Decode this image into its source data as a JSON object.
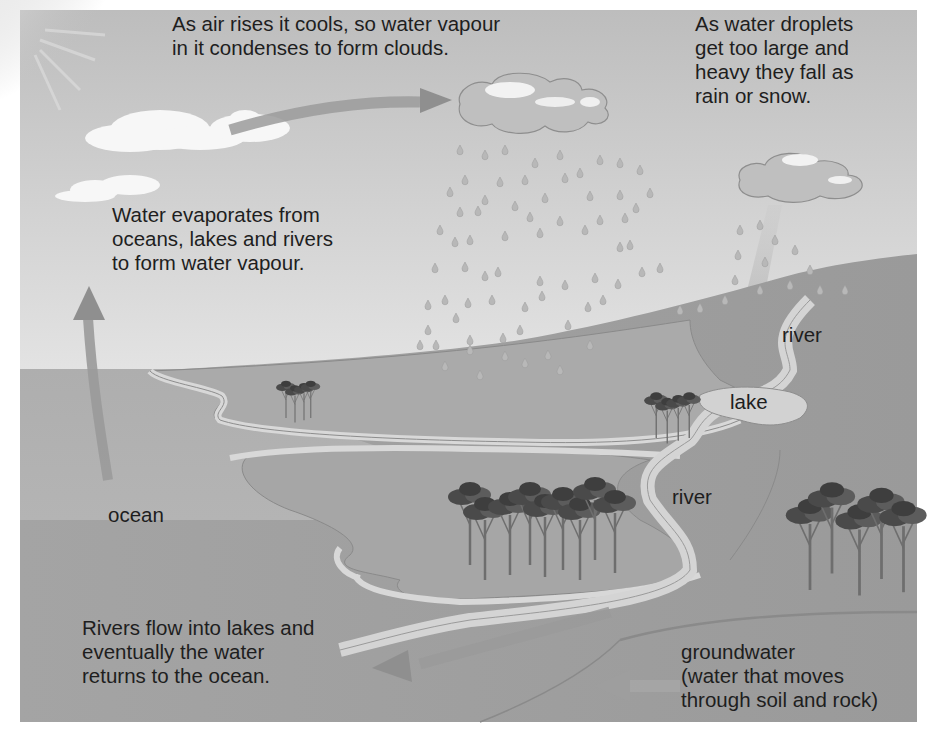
{
  "diagram": {
    "annotations": {
      "condensation": "As air rises it cools, so water vapour\nin it condenses to form clouds.",
      "precipitation": "As water droplets\nget too large and\nheavy they fall as\nrain or snow.",
      "evaporation": "Water evaporates from\noceans, lakes and rivers\nto form water vapour.",
      "runoff": "Rivers flow into lakes and\neventually the water\nreturns to the ocean.",
      "groundwater": "groundwater\n(water that moves\nthrough soil and rock)"
    },
    "labels": {
      "ocean": "ocean",
      "river_upper": "river",
      "lake": "lake",
      "river_lower": "river"
    },
    "elements": [
      "sun-icon",
      "cloud-icon",
      "rain-cloud-icon",
      "raindrop-icon",
      "tree-cluster-icon",
      "arrow-icon"
    ],
    "colors": {
      "sky_top": "#bdbdbd",
      "sky_bottom": "#f4f4f4",
      "ocean": "#b4b4b4",
      "land": "#a9a9a9",
      "hill": "#9c9c9c",
      "river": "#d2d2d2",
      "arrow": "#8f8f8f",
      "text": "#1e1e1e"
    }
  }
}
